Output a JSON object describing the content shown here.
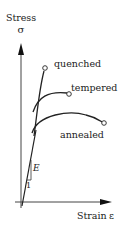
{
  "diagram": {
    "y_axis": {
      "label": "Stress",
      "symbol": "σ"
    },
    "x_axis": {
      "label": "Strain",
      "symbol": "ε"
    },
    "curves": [
      {
        "name": "quenched",
        "label": "quenched"
      },
      {
        "name": "tempered",
        "label": "tempered"
      },
      {
        "name": "annealed",
        "label": "annealed"
      }
    ],
    "slope": {
      "label": "E",
      "unit": "1"
    },
    "colors": {
      "line": "#222222",
      "axis": "#444444"
    }
  }
}
